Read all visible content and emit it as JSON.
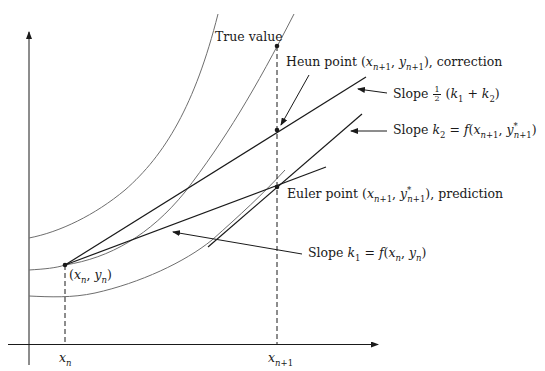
{
  "figure": {
    "colors": {
      "axis": "#1a1a1a",
      "line": "#1a1a1a",
      "curve": "#6e6e6e",
      "background": "#ffffff"
    }
  },
  "labels": {
    "true_value": "True value",
    "heun_point_prefix": "Heun point ",
    "heun_point_coords": "(x_{n+1}, y_{n+1})",
    "heun_point_suffix": ", correction",
    "euler_point_prefix": "Euler point ",
    "euler_point_coords": "(x_{n+1}, y*_{n+1})",
    "euler_point_suffix": ", prediction",
    "slope_avg_prefix": "Slope ",
    "slope_avg_frac_num": "1",
    "slope_avg_frac_den": "2",
    "slope_avg_expr": "(k_1 + k_2)",
    "slope_k2_prefix": "Slope ",
    "slope_k2_expr": "k_2 = f(x_{n+1}, y*_{n+1})",
    "slope_k1_prefix": "Slope ",
    "slope_k1_expr": "k_1 = f(x_n, y_n)",
    "start_point": "(x_n, y_n)",
    "x_tick_n": "x_n",
    "x_tick_n1": "x_{n+1}"
  },
  "points": {
    "start": {
      "x": 65,
      "y": 265
    },
    "euler": {
      "x": 277,
      "y": 187
    },
    "heun": {
      "x": 277,
      "y": 130
    },
    "true_value": {
      "x": 277,
      "y": 46
    }
  },
  "axes": {
    "x_axis_y": 345,
    "y_axis_x": 29,
    "x_n_pos": 65,
    "x_n1_pos": 277
  }
}
